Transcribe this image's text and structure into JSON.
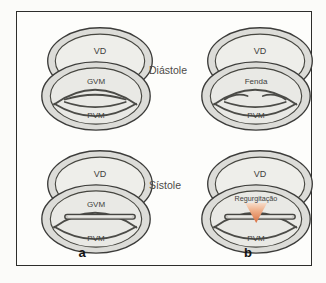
{
  "figure": {
    "row_labels": {
      "top": "Diástole",
      "bottom": "Sístole"
    },
    "panel_labels": {
      "left": "a",
      "right": "b"
    },
    "units": {
      "top_left": {
        "vd": "VD",
        "upper": "GVM",
        "lower": "PVM"
      },
      "top_right": {
        "vd": "VD",
        "upper": "Fenda",
        "lower": "PVM"
      },
      "bottom_left": {
        "vd": "VD",
        "upper": "GVM",
        "lower": "PVM"
      },
      "bottom_right": {
        "vd": "VD",
        "upper": "Regurgitação",
        "lower": "PVM"
      }
    },
    "colors": {
      "ring_gray": "#dcdcd8",
      "interior_gray": "#edede9",
      "outline_dark": "#3c3c3a",
      "regurgitation_jet_orange": "#d96f41"
    }
  }
}
